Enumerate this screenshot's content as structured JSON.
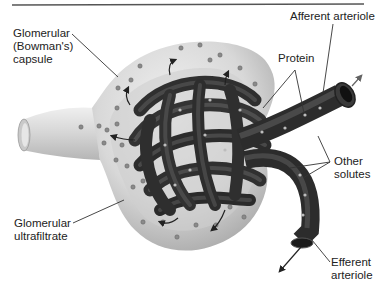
{
  "figure": {
    "type": "anatomical-diagram"
  },
  "labels": {
    "bowmans_capsule": "Glomerular\n(Bowman's)\ncapsule",
    "afferent_arteriole": "Afferent arteriole",
    "protein": "Protein",
    "other_solutes": "Other\nsolutes",
    "ultrafiltrate": "Glomerular\nultrafiltrate",
    "efferent_arteriole": "Efferent\narteriole"
  },
  "colors": {
    "capsule_fill": "#d9d9d9",
    "capsule_shadow": "#a8a8a8",
    "vessel_dark": "#2e2e2e",
    "vessel_highlight": "#6a6a6a",
    "particle": "#8a8a8a",
    "leader_line": "#333333",
    "rule": "#555555"
  }
}
